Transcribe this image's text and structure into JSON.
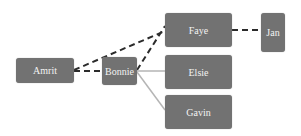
{
  "diagram": {
    "type": "tree",
    "colors": {
      "node_fill": "#727272",
      "node_text": "#f2f2f2",
      "dashed_edge": "#2b2b2b",
      "solid_edge": "#b5b5b5"
    },
    "nodes": [
      {
        "id": "amrit",
        "label": "Amrit"
      },
      {
        "id": "bonnie",
        "label": "Bonnie"
      },
      {
        "id": "faye",
        "label": "Faye"
      },
      {
        "id": "jan",
        "label": "Jan"
      },
      {
        "id": "elsie",
        "label": "Elsie"
      },
      {
        "id": "gavin",
        "label": "Gavin"
      }
    ],
    "edges": [
      {
        "from": "amrit",
        "to": "faye",
        "style": "dashed"
      },
      {
        "from": "amrit",
        "to": "bonnie",
        "style": "dashed"
      },
      {
        "from": "bonnie",
        "to": "faye",
        "style": "dashed"
      },
      {
        "from": "faye",
        "to": "jan",
        "style": "dashed"
      },
      {
        "from": "bonnie",
        "to": "elsie",
        "style": "solid"
      },
      {
        "from": "bonnie",
        "to": "gavin",
        "style": "solid"
      }
    ]
  }
}
